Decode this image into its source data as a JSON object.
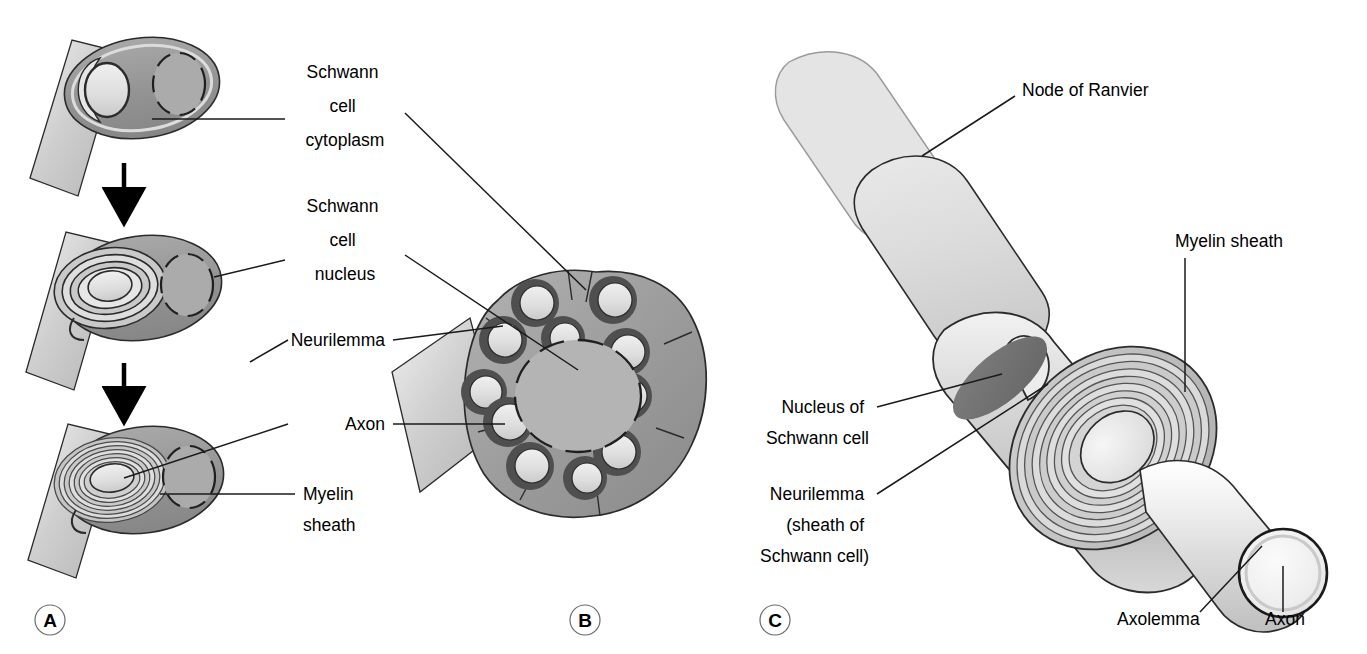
{
  "figure": {
    "background_color": "#ffffff",
    "line_color": "#1a1a1a"
  },
  "palette": {
    "cytoplasm_mid_gray": "#9a9a9a",
    "cytoplasm_dark_gray": "#808080",
    "myelin_light": "#cccccc",
    "axon_pale": "#e0e0e0",
    "sheath_very_light": "#d8d8d8",
    "nucleus_dark": "#6e6e6e",
    "outline": "#2b2b2b",
    "white": "#ffffff"
  },
  "panels": [
    {
      "id": "A",
      "letter": "A",
      "letter_x": 50,
      "letter_y": 620,
      "caption": "Stages of myelination: a Schwann cell wraps repeatedly around a single axon"
    },
    {
      "id": "B",
      "letter": "B",
      "letter_x": 585,
      "letter_y": 620,
      "caption": "Cross-section of an unmyelinated nerve fibre: several axons embedded in one Schwann cell"
    },
    {
      "id": "C",
      "letter": "C",
      "letter_x": 775,
      "letter_y": 620,
      "caption": "Three-dimensional view of a myelinated nerve fibre cut open to show the spiral myelin sheath"
    }
  ],
  "labels": [
    {
      "id": "schwann-cell-cytoplasm",
      "lines": [
        "Schwann",
        "cell",
        "cytoplasm"
      ],
      "x": 345,
      "y": 78,
      "anchor": "middle",
      "line_height": 34
    },
    {
      "id": "schwann-cell-nucleus",
      "lines": [
        "Schwann",
        "cell",
        "nucleus"
      ],
      "x": 345,
      "y": 212,
      "anchor": "middle",
      "line_height": 34
    },
    {
      "id": "neurilemma",
      "lines": [
        "Neurilemma"
      ],
      "x": 385,
      "y": 346,
      "anchor": "end",
      "line_height": 34
    },
    {
      "id": "axon-b",
      "lines": [
        "Axon"
      ],
      "x": 385,
      "y": 430,
      "anchor": "end",
      "line_height": 34
    },
    {
      "id": "myelin-sheath-a",
      "lines": [
        "Myelin",
        "sheath"
      ],
      "x": 303,
      "y": 500,
      "anchor": "start",
      "line_height": 31
    },
    {
      "id": "node-of-ranvier",
      "lines": [
        "Node of Ranvier"
      ],
      "x": 1022,
      "y": 96,
      "anchor": "start",
      "line_height": 34
    },
    {
      "id": "myelin-sheath-c",
      "lines": [
        "Myelin sheath"
      ],
      "x": 1175,
      "y": 247,
      "anchor": "start",
      "line_height": 34
    },
    {
      "id": "nucleus-of-schwann-cell",
      "lines": [
        "Nucleus of",
        "Schwann cell"
      ],
      "x": 869,
      "y": 413,
      "anchor": "end",
      "line_height": 31
    },
    {
      "id": "neurilemma-sheath-of-schwann-cell",
      "lines": [
        "Neurilemma",
        "(sheath of",
        "Schwann cell)"
      ],
      "x": 869,
      "y": 500,
      "anchor": "end",
      "line_height": 31
    },
    {
      "id": "axolemma",
      "lines": [
        "Axolemma"
      ],
      "x": 1117,
      "y": 625,
      "anchor": "start",
      "line_height": 34
    },
    {
      "id": "axon-c",
      "lines": [
        "Axon"
      ],
      "x": 1265,
      "y": 625,
      "anchor": "start",
      "line_height": 34
    }
  ]
}
